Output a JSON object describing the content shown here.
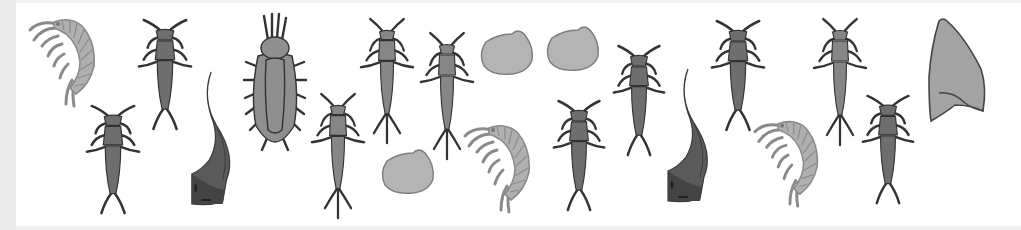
{
  "image": {
    "description": "Grayscale illustration strip of freshwater aquatic macroinvertebrates",
    "width": 1021,
    "height": 230,
    "background": "#ffffff"
  },
  "colors": {
    "stonefly_fill": "#6e6e6e",
    "mayfly_fill": "#868686",
    "outline": "#333333",
    "amphipod_fill": "#b0b0b0",
    "amphipod_outline": "#8a8a8a",
    "leech_fill": "#5a5a5a",
    "leech_dark": "#444444",
    "larva_fill": "#8f8f8f",
    "clam_fill": "#b4b4b4",
    "clam_outline": "#7c7c7c",
    "shell_fill": "#a3a3a3"
  },
  "organisms": [
    {
      "type": "amphipod",
      "label": "scud",
      "x": 26,
      "y": 14,
      "w": 74,
      "h": 94,
      "flip": false
    },
    {
      "type": "stonefly",
      "label": "stonefly nymph",
      "x": 136,
      "y": 18,
      "w": 58,
      "h": 114
    },
    {
      "type": "stonefly",
      "label": "stonefly nymph",
      "x": 84,
      "y": 104,
      "w": 58,
      "h": 112
    },
    {
      "type": "leech",
      "label": "leech",
      "x": 188,
      "y": 70,
      "w": 52,
      "h": 140
    },
    {
      "type": "larva",
      "label": "beetle larva",
      "x": 244,
      "y": 14,
      "w": 62,
      "h": 138
    },
    {
      "type": "mayfly",
      "label": "mayfly nymph",
      "x": 310,
      "y": 94,
      "w": 56,
      "h": 126
    },
    {
      "type": "mayfly",
      "label": "mayfly nymph",
      "x": 359,
      "y": 19,
      "w": 56,
      "h": 126
    },
    {
      "type": "mayfly",
      "label": "mayfly nymph",
      "x": 419,
      "y": 33,
      "w": 56,
      "h": 128
    },
    {
      "type": "clam",
      "label": "fingernail clam",
      "x": 478,
      "y": 28,
      "w": 58,
      "h": 48
    },
    {
      "type": "clam",
      "label": "fingernail clam",
      "x": 544,
      "y": 24,
      "w": 58,
      "h": 48
    },
    {
      "type": "clam",
      "label": "fingernail clam",
      "x": 379,
      "y": 147,
      "w": 58,
      "h": 48
    },
    {
      "type": "amphipod",
      "label": "scud",
      "x": 461,
      "y": 120,
      "w": 74,
      "h": 94,
      "flip": false
    },
    {
      "type": "stonefly",
      "label": "stonefly nymph",
      "x": 551,
      "y": 99,
      "w": 56,
      "h": 114
    },
    {
      "type": "stonefly",
      "label": "stonefly nymph",
      "x": 611,
      "y": 44,
      "w": 56,
      "h": 114
    },
    {
      "type": "leech",
      "label": "leech",
      "x": 664,
      "y": 67,
      "w": 54,
      "h": 140
    },
    {
      "type": "stonefly",
      "label": "stonefly nymph",
      "x": 709,
      "y": 19,
      "w": 58,
      "h": 114
    },
    {
      "type": "amphipod",
      "label": "scud",
      "x": 751,
      "y": 116,
      "w": 72,
      "h": 92,
      "flip": false
    },
    {
      "type": "mayfly",
      "label": "mayfly nymph",
      "x": 812,
      "y": 19,
      "w": 56,
      "h": 128
    },
    {
      "type": "stonefly",
      "label": "stonefly nymph",
      "x": 860,
      "y": 94,
      "w": 56,
      "h": 112
    },
    {
      "type": "snail_shell",
      "label": "limpet shell",
      "x": 925,
      "y": 17,
      "w": 62,
      "h": 106
    }
  ]
}
